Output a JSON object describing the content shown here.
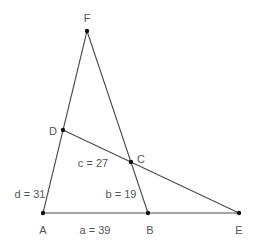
{
  "diagram": {
    "type": "geometry",
    "points": [
      {
        "id": "F",
        "label": "F",
        "x": 87,
        "y": 31,
        "lx": 87,
        "ly": 19
      },
      {
        "id": "D",
        "label": "D",
        "x": 63,
        "y": 130,
        "lx": 53,
        "ly": 132
      },
      {
        "id": "C",
        "label": "C",
        "x": 131,
        "y": 162,
        "lx": 141,
        "ly": 160
      },
      {
        "id": "A",
        "label": "A",
        "x": 43,
        "y": 213,
        "lx": 43,
        "ly": 231
      },
      {
        "id": "B",
        "label": "B",
        "x": 148,
        "y": 213,
        "lx": 150,
        "ly": 231
      },
      {
        "id": "E",
        "label": "E",
        "x": 239,
        "y": 213,
        "lx": 239,
        "ly": 231
      }
    ],
    "segments": [
      {
        "id": "AF",
        "from": "A",
        "to": "F"
      },
      {
        "id": "FB",
        "from": "F",
        "to": "B"
      },
      {
        "id": "AE",
        "from": "A",
        "to": "E"
      },
      {
        "id": "DE",
        "from": "D",
        "to": "E"
      }
    ],
    "measurements": [
      {
        "id": "a",
        "text": "a = 39",
        "x": 95,
        "y": 231
      },
      {
        "id": "b",
        "text": "b = 19",
        "x": 121,
        "y": 195
      },
      {
        "id": "c",
        "text": "c = 27",
        "x": 93,
        "y": 164
      },
      {
        "id": "d",
        "text": "d = 31",
        "x": 30,
        "y": 195
      }
    ],
    "colors": {
      "line": "#4a4a4a",
      "point": "#111111",
      "text": "#555555",
      "background": "#ffffff"
    }
  }
}
